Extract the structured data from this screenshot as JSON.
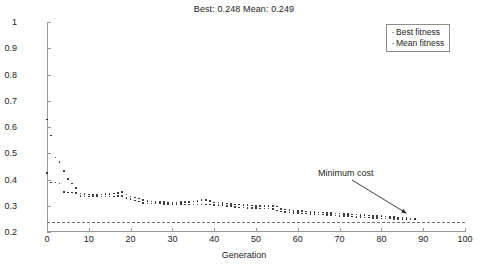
{
  "chart_data": {
    "type": "scatter",
    "title": "Best: 0.248 Mean: 0.249",
    "xlabel": "Generation",
    "ylabel": "Total cost rate ($/h)",
    "xlim": [
      0,
      100
    ],
    "ylim": [
      0.2,
      1
    ],
    "xticks": [
      0,
      10,
      20,
      30,
      40,
      50,
      60,
      70,
      80,
      90,
      100
    ],
    "yticks": [
      0.2,
      0.3,
      0.4,
      0.5,
      0.6,
      0.7,
      0.8,
      0.9,
      1
    ],
    "grid": false,
    "legend_position": "top-right",
    "legend": [
      "Best fitness",
      "Mean fitness"
    ],
    "marker_color": "#1a1a1a",
    "reference_line": {
      "label": "Minimum cost",
      "value": 0.24,
      "style": "dashed",
      "color": "#6f6f6f"
    },
    "annotations": [
      {
        "text": "Minimum cost",
        "target_x": 88,
        "target_y": 0.25
      }
    ],
    "x": [
      0,
      1,
      2,
      3,
      4,
      5,
      6,
      7,
      8,
      9,
      10,
      11,
      12,
      13,
      14,
      15,
      16,
      17,
      18,
      19,
      20,
      21,
      22,
      23,
      24,
      25,
      26,
      27,
      28,
      29,
      30,
      31,
      32,
      33,
      34,
      35,
      36,
      37,
      38,
      39,
      40,
      41,
      42,
      43,
      44,
      45,
      46,
      47,
      48,
      49,
      50,
      51,
      52,
      53,
      54,
      55,
      56,
      57,
      58,
      59,
      60,
      61,
      62,
      63,
      64,
      65,
      66,
      67,
      68,
      69,
      70,
      71,
      72,
      73,
      74,
      75,
      76,
      77,
      78,
      79,
      80,
      81,
      82,
      83,
      84,
      85,
      86,
      87,
      88
    ],
    "series": [
      {
        "name": "Best fitness",
        "values": [
          0.425,
          0.389,
          0.388,
          0.385,
          0.353,
          0.351,
          0.35,
          0.348,
          0.337,
          0.336,
          0.336,
          0.335,
          0.335,
          0.335,
          0.336,
          0.336,
          0.336,
          0.337,
          0.337,
          0.33,
          0.325,
          0.32,
          0.316,
          0.311,
          0.309,
          0.308,
          0.308,
          0.308,
          0.307,
          0.307,
          0.307,
          0.306,
          0.306,
          0.305,
          0.305,
          0.305,
          0.305,
          0.305,
          0.304,
          0.304,
          0.303,
          0.303,
          0.302,
          0.3,
          0.298,
          0.296,
          0.294,
          0.293,
          0.292,
          0.291,
          0.291,
          0.29,
          0.29,
          0.29,
          0.288,
          0.282,
          0.278,
          0.276,
          0.274,
          0.273,
          0.272,
          0.271,
          0.27,
          0.269,
          0.268,
          0.267,
          0.266,
          0.265,
          0.264,
          0.263,
          0.262,
          0.261,
          0.26,
          0.259,
          0.258,
          0.257,
          0.256,
          0.255,
          0.254,
          0.253,
          0.252,
          0.251,
          0.251,
          0.25,
          0.25,
          0.249,
          0.249,
          0.248,
          0.248
        ]
      },
      {
        "name": "Mean fitness",
        "values": [
          0.628,
          0.567,
          0.484,
          0.466,
          0.432,
          0.403,
          0.385,
          0.368,
          0.347,
          0.344,
          0.343,
          0.342,
          0.342,
          0.343,
          0.344,
          0.345,
          0.346,
          0.348,
          0.352,
          0.343,
          0.336,
          0.331,
          0.327,
          0.323,
          0.318,
          0.316,
          0.315,
          0.314,
          0.314,
          0.313,
          0.313,
          0.313,
          0.314,
          0.315,
          0.315,
          0.316,
          0.318,
          0.321,
          0.323,
          0.318,
          0.313,
          0.312,
          0.311,
          0.309,
          0.307,
          0.305,
          0.304,
          0.303,
          0.302,
          0.301,
          0.3,
          0.299,
          0.298,
          0.299,
          0.3,
          0.297,
          0.288,
          0.285,
          0.283,
          0.281,
          0.28,
          0.279,
          0.278,
          0.277,
          0.276,
          0.275,
          0.274,
          0.273,
          0.272,
          0.271,
          0.27,
          0.269,
          0.268,
          0.267,
          0.266,
          0.265,
          0.264,
          0.263,
          0.262,
          0.261,
          0.26,
          0.259,
          0.258,
          0.257,
          0.256,
          0.255,
          0.253,
          0.251,
          0.25
        ]
      }
    ]
  }
}
